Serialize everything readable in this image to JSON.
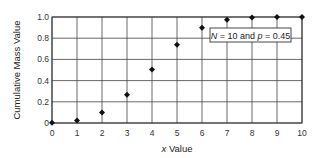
{
  "chart_data": {
    "type": "scatter",
    "title": "",
    "xlabel": "x Value",
    "ylabel": "Cumulative Mass Value",
    "x": [
      0,
      1,
      2,
      3,
      4,
      5,
      6,
      7,
      8,
      9,
      10
    ],
    "series": [
      {
        "name": "Binomial CDF (N = 10, p = 0.45)",
        "values": [
          0.003,
          0.023,
          0.1,
          0.266,
          0.504,
          0.738,
          0.898,
          0.973,
          0.995,
          1.0,
          1.0
        ],
        "marker": "diamond",
        "color": "#111111"
      }
    ],
    "xlim": [
      0,
      10
    ],
    "ylim": [
      0,
      1.0
    ],
    "x_ticks": [
      "0",
      "1",
      "2",
      "3",
      "4",
      "5",
      "6",
      "7",
      "8",
      "9",
      "10"
    ],
    "y_ticks": [
      "0",
      "0.2",
      "0.4",
      "0.6",
      "0.8",
      "1.0"
    ],
    "y_tick_values": [
      0,
      0.2,
      0.4,
      0.6,
      0.8,
      1.0
    ],
    "grid": true,
    "annotation": {
      "N_symbol": "N",
      "N_value": " = 10 and ",
      "p_symbol": "p",
      "p_value": " = 0.45"
    }
  },
  "labels": {
    "xlabel_var": "x",
    "xlabel_rest": " Value",
    "ylabel": "Cumulative Mass Value"
  }
}
